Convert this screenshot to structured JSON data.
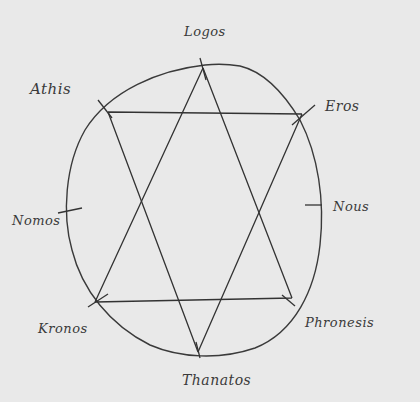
{
  "diagram": {
    "type": "hand-drawn hexagram inscribed in circle",
    "colors": {
      "paper": "#e9e9e9",
      "ink": "#2f2f2f",
      "border": "#ffffff"
    },
    "labels": {
      "top": "Logos",
      "upper_left": "Athis",
      "upper_right": "Eros",
      "right": "Nous",
      "left": "Nomos",
      "lower_left": "Kronos",
      "lower_right": "Phronesis",
      "bottom": "Thanatos"
    }
  }
}
